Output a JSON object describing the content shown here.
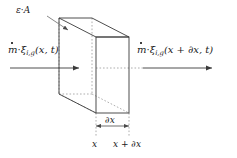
{
  "figure": {
    "colors": {
      "stroke_solid": "#3a3a3a",
      "stroke_hidden": "#9a9a9a",
      "text": "#1a1a1a",
      "background": "#ffffff"
    },
    "labels": {
      "area_label": {
        "symbol_epsilon": "ε",
        "operator": "·",
        "symbol_area": "A",
        "full_text": "ε · A"
      },
      "flux_in": {
        "symbol_mdot": "m",
        "operator": "·",
        "symbol_xi": "ξ",
        "subscript": "i,g",
        "argument": "(x, t)",
        "full_text": "ṁ · ξ i,g (x, t)"
      },
      "flux_out": {
        "symbol_mdot": "m",
        "operator": "·",
        "symbol_xi": "ξ",
        "subscript": "i,g",
        "argument": "(x + ∂x, t)",
        "full_text": "ṁ · ξ i,g (x + ∂x, t)"
      },
      "dimension": {
        "full_text": "∂x",
        "partial": "∂",
        "variable": "x"
      },
      "tick_left": {
        "full_text": "x"
      },
      "tick_right": {
        "partial": "∂",
        "full_text": "x + ∂x"
      }
    },
    "geometry": {
      "front_face": {
        "x": 96,
        "y": 37,
        "width": 33,
        "height": 76
      },
      "depth_offset": {
        "dx": -37,
        "dy": -19
      },
      "arrow_in": {
        "x1": 10,
        "x2": 80,
        "y": 68
      },
      "arrow_out": {
        "x1": 143,
        "x2": 213,
        "y": 68
      },
      "dimension_line": {
        "x1": 96,
        "x2": 129,
        "y": 125
      }
    }
  }
}
